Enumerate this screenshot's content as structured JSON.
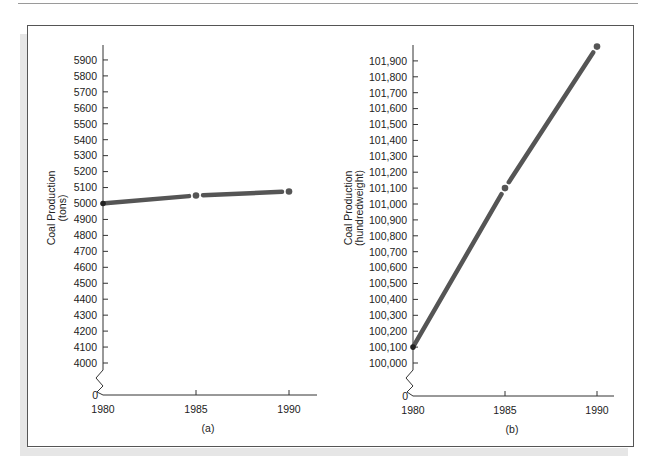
{
  "figure": {
    "panels": [
      {
        "caption": "(a)",
        "ylabel_line1": "Coal Production",
        "ylabel_line2": "(tons)",
        "zero_label": "0",
        "yticks": [
          "4000",
          "4100",
          "4200",
          "4300",
          "4400",
          "4500",
          "4600",
          "4700",
          "4800",
          "4900",
          "5000",
          "5100",
          "5200",
          "5300",
          "5400",
          "5500",
          "5600",
          "5700",
          "5800",
          "5900"
        ],
        "xticks": [
          "1980",
          "1985",
          "1990"
        ]
      },
      {
        "caption": "(b)",
        "ylabel_line1": "Coal Production",
        "ylabel_line2": "(hundredweight)",
        "zero_label": "0",
        "yticks": [
          "100,000",
          "100,100",
          "100,200",
          "100,300",
          "100,400",
          "100,500",
          "100,600",
          "100,700",
          "100,800",
          "100,900",
          "101,000",
          "101,100",
          "101,200",
          "101,300",
          "101,400",
          "101,500",
          "101,600",
          "101,700",
          "101,800",
          "101,900"
        ],
        "xticks": [
          "1980",
          "1985",
          "1990"
        ]
      }
    ],
    "colors": {
      "line": "#555555",
      "axis": "#333333",
      "frame": "#555555"
    }
  },
  "chart_data": [
    {
      "type": "line",
      "title": "(a)",
      "xlabel": "",
      "ylabel": "Coal Production (tons)",
      "x": [
        1980,
        1985,
        1990
      ],
      "series": [
        {
          "name": "Coal Production",
          "values": [
            5000,
            5050,
            5075
          ]
        }
      ],
      "xticks": [
        "1980",
        "1985",
        "1990"
      ],
      "yticks": [
        0,
        4000,
        4100,
        4200,
        4300,
        4400,
        4500,
        4600,
        4700,
        4800,
        4900,
        5000,
        5100,
        5200,
        5300,
        5400,
        5500,
        5600,
        5700,
        5800,
        5900
      ],
      "ylim": [
        0,
        5950
      ],
      "axis_break": "between 0 and 4000",
      "grid": false,
      "legend": "none"
    },
    {
      "type": "line",
      "title": "(b)",
      "xlabel": "",
      "ylabel": "Coal Production (hundredweight)",
      "x": [
        1980,
        1985,
        1990
      ],
      "series": [
        {
          "name": "Coal Production",
          "values": [
            100100,
            101100,
            101990
          ]
        }
      ],
      "xticks": [
        "1980",
        "1985",
        "1990"
      ],
      "yticks": [
        0,
        100000,
        100100,
        100200,
        100300,
        100400,
        100500,
        100600,
        100700,
        100800,
        100900,
        101000,
        101100,
        101200,
        101300,
        101400,
        101500,
        101600,
        101700,
        101800,
        101900
      ],
      "ylim": [
        0,
        101990
      ],
      "axis_break": "between 0 and 100,000",
      "grid": false,
      "legend": "none"
    }
  ]
}
